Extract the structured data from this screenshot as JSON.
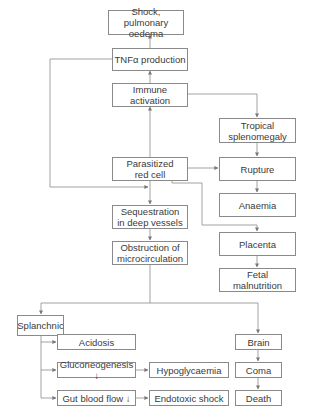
{
  "diagram": {
    "type": "flowchart",
    "nodes": {
      "shock": "Shock, pulmonary oedema",
      "tnf": "TNFα production",
      "immune": "Immune activation",
      "tropical": "Tropical splenomegaly",
      "parasitized": "Parasitized red cell",
      "rupture": "Rupture",
      "anaemia": "Anaemia",
      "sequestration": "Sequestration in deep vessels",
      "obstruction": "Obstruction of microcirculation",
      "placenta": "Placenta",
      "fetal": "Fetal malnutrition",
      "splanchnic": "Splanchnic",
      "acidosis": "Acidosis",
      "gluconeogenesis": "Gluconeogenesis ↓",
      "hypoglycaemia": "Hypoglycaemia",
      "gut": "Gut blood flow ↓",
      "endotoxic": "Endotoxic shock",
      "brain": "Brain",
      "coma": "Coma",
      "death": "Death"
    },
    "edges": [
      [
        "tnf",
        "shock"
      ],
      [
        "immune",
        "tnf"
      ],
      [
        "parasitized",
        "immune"
      ],
      [
        "immune",
        "tropical"
      ],
      [
        "tropical",
        "rupture"
      ],
      [
        "parasitized",
        "rupture"
      ],
      [
        "rupture",
        "anaemia"
      ],
      [
        "tnf",
        "parasitized"
      ],
      [
        "parasitized",
        "sequestration"
      ],
      [
        "parasitized",
        "placenta"
      ],
      [
        "placenta",
        "fetal"
      ],
      [
        "sequestration",
        "obstruction"
      ],
      [
        "obstruction",
        "splanchnic"
      ],
      [
        "obstruction",
        "brain"
      ],
      [
        "splanchnic",
        "acidosis"
      ],
      [
        "splanchnic",
        "gluconeogenesis"
      ],
      [
        "splanchnic",
        "gut"
      ],
      [
        "gluconeogenesis",
        "hypoglycaemia"
      ],
      [
        "gut",
        "endotoxic"
      ],
      [
        "brain",
        "coma"
      ],
      [
        "coma",
        "death"
      ]
    ]
  }
}
